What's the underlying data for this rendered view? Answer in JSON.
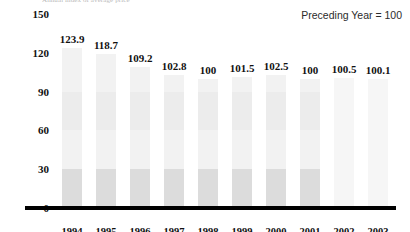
{
  "chart_data": {
    "type": "bar",
    "title": "Annual index of average price",
    "subtitle": "",
    "note": "Preceding Year = 100",
    "xlabel": "",
    "ylabel": "",
    "categories": [
      "1994",
      "1995",
      "1996",
      "1997",
      "1998",
      "1999",
      "2000",
      "2001",
      "2002",
      "2003"
    ],
    "values": [
      123.9,
      118.7,
      109.2,
      102.8,
      100,
      101.5,
      102.5,
      100,
      100.5,
      100.1
    ],
    "data_labels": [
      "123.9",
      "118.7",
      "109.2",
      "102.8",
      "100",
      "101.5",
      "102.5",
      "100",
      "100.5",
      "100.1"
    ],
    "ylim": [
      0,
      150
    ],
    "yticks": [
      0,
      30,
      60,
      90,
      120,
      150
    ],
    "ytick_labels": [
      "0",
      "30",
      "60",
      "90",
      "120",
      "150"
    ],
    "grid": false,
    "legend": null,
    "series": [
      {
        "name": "Index",
        "values": [
          123.9,
          118.7,
          109.2,
          102.8,
          100,
          101.5,
          102.5,
          100,
          100.5,
          100.1
        ]
      }
    ],
    "colors": {
      "bar_fill": "#f2f2f2",
      "bar_band_low": "#dcdcdc",
      "bar_band_mid": "#ececec",
      "bar_fill_pale": "#f6f6f6",
      "axis": "#000000",
      "text": "#111111",
      "note_text": "#2b2b2b"
    }
  }
}
